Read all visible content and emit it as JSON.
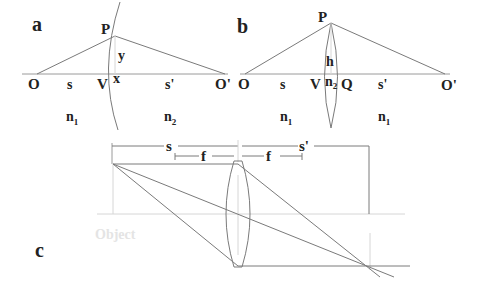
{
  "figure": {
    "panels": [
      {
        "id": "a",
        "label": "a",
        "title": "Refraction at a single spherical surface",
        "points": {
          "P": "P",
          "O": "O",
          "V": "V",
          "x": "x",
          "y": "y",
          "O_prime": "O'"
        },
        "distances": {
          "s": "s",
          "s_prime": "s'"
        },
        "media": {
          "left": "n",
          "left_sub": "1",
          "right": "n",
          "right_sub": "2"
        }
      },
      {
        "id": "b",
        "label": "b",
        "title": "Thin lens",
        "points": {
          "P": "P",
          "O": "O",
          "V": "V",
          "Q": "Q",
          "h": "h",
          "O_prime": "O'"
        },
        "distances": {
          "s": "s",
          "s_prime": "s'"
        },
        "media": {
          "left": "n",
          "left_sub": "1",
          "lens": "n",
          "lens_sub": "2",
          "right": "n",
          "right_sub": "1"
        }
      },
      {
        "id": "c",
        "label": "c",
        "title": "Ray diagram for a converging lens",
        "dimensions": {
          "s": "s",
          "f_left": "f",
          "f_right": "f",
          "s_prime": "s'"
        },
        "object_label": "Object"
      }
    ]
  }
}
